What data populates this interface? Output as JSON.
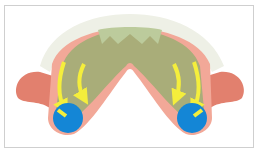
{
  "figure": {
    "colors": {
      "border": "#cfcfcf",
      "gum": "#f2a898",
      "gum_dark": "#e2806e",
      "palate": "#a9ad79",
      "palate_light": "#bccb9c",
      "teeth": "#eef0e6",
      "arrow": "#f4ee3c",
      "circle": "#1486d6"
    },
    "elements": [
      "teeth-arch",
      "palate",
      "left-flange",
      "right-flange",
      "arrows",
      "blue-circles"
    ]
  }
}
